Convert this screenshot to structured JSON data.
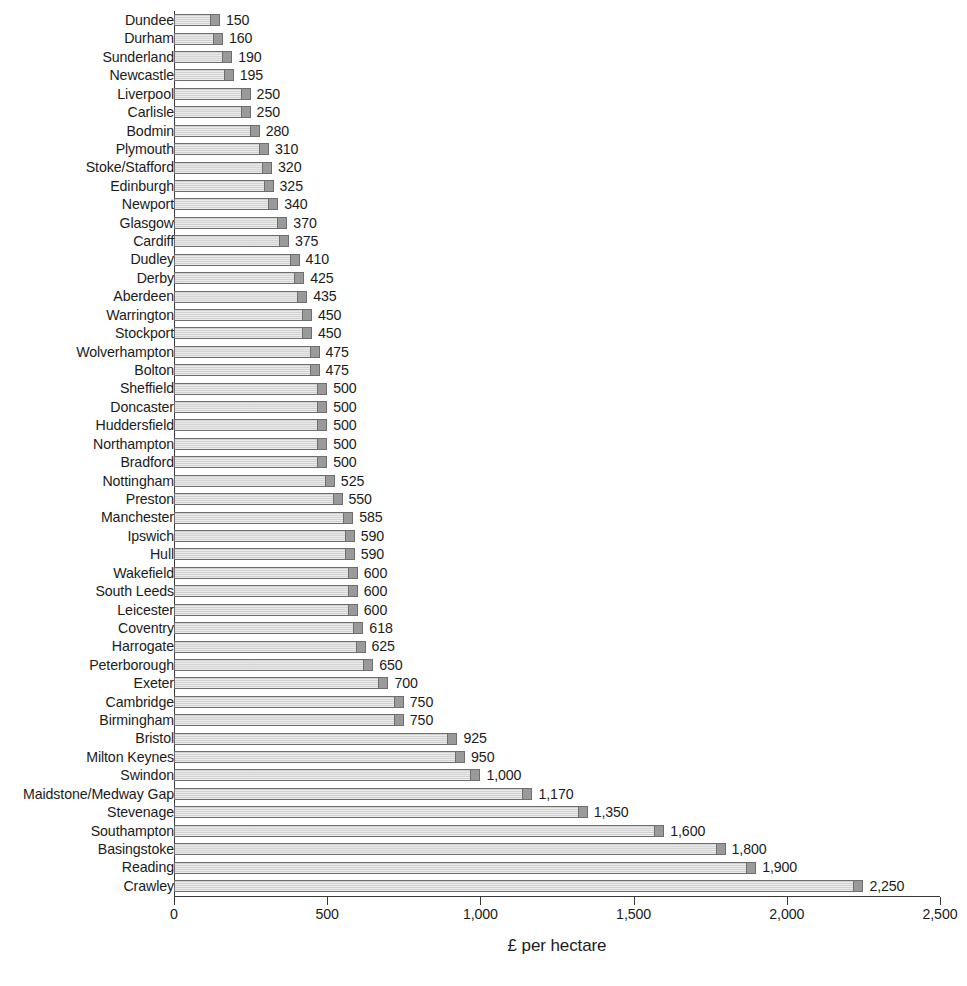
{
  "chart": {
    "type": "bar",
    "orientation": "horizontal",
    "axis_title": "£ per hectare",
    "tick_labels": [
      "0",
      "500",
      "1,000",
      "1,500",
      "2,000",
      "2,500"
    ],
    "tick_values": [
      0,
      500,
      1000,
      1500,
      2000,
      2500
    ],
    "colors": {
      "bar_fill": "#d2d2d2",
      "bar_cap": "#9a9a9a",
      "bar_border": "#6e6e6e",
      "text": "#1b1b1b",
      "axis": "#3a3a3a",
      "background": "#ffffff"
    }
  },
  "chart_data": {
    "type": "bar",
    "title": "",
    "subtitle": "",
    "xlabel": "£ per hectare",
    "ylabel": "",
    "xlim": [
      0,
      2500
    ],
    "grid": false,
    "legend": null,
    "orientation": "horizontal",
    "categories": [
      "Dundee",
      "Durham",
      "Sunderland",
      "Newcastle",
      "Liverpool",
      "Carlisle",
      "Bodmin",
      "Plymouth",
      "Stoke/Stafford",
      "Edinburgh",
      "Newport",
      "Glasgow",
      "Cardiff",
      "Dudley",
      "Derby",
      "Aberdeen",
      "Warrington",
      "Stockport",
      "Wolverhampton",
      "Bolton",
      "Sheffield",
      "Doncaster",
      "Huddersfield",
      "Northampton",
      "Bradford",
      "Nottingham",
      "Preston",
      "Manchester",
      "Ipswich",
      "Hull",
      "Wakefield",
      "South Leeds",
      "Leicester",
      "Coventry",
      "Harrogate",
      "Peterborough",
      "Exeter",
      "Cambridge",
      "Birmingham",
      "Bristol",
      "Milton Keynes",
      "Swindon",
      "Maidstone/Medway Gap",
      "Stevenage",
      "Southampton",
      "Basingstoke",
      "Reading",
      "Crawley"
    ],
    "values": [
      150,
      160,
      190,
      195,
      250,
      250,
      280,
      310,
      320,
      325,
      340,
      370,
      375,
      410,
      425,
      435,
      450,
      450,
      475,
      475,
      500,
      500,
      500,
      500,
      500,
      525,
      550,
      585,
      590,
      590,
      600,
      600,
      600,
      618,
      625,
      650,
      700,
      750,
      750,
      925,
      950,
      1000,
      1170,
      1350,
      1600,
      1800,
      1900,
      2250
    ],
    "value_labels": [
      "150",
      "160",
      "190",
      "195",
      "250",
      "250",
      "280",
      "310",
      "320",
      "325",
      "340",
      "370",
      "375",
      "410",
      "425",
      "435",
      "450",
      "450",
      "475",
      "475",
      "500",
      "500",
      "500",
      "500",
      "500",
      "525",
      "550",
      "585",
      "590",
      "590",
      "600",
      "600",
      "600",
      "618",
      "625",
      "650",
      "700",
      "750",
      "750",
      "925",
      "950",
      "1,000",
      "1,170",
      "1,350",
      "1,600",
      "1,800",
      "1,900",
      "2,250"
    ]
  }
}
